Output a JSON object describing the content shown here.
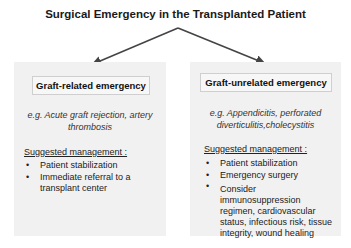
{
  "title": "Surgical Emergency in the Transplanted Patient",
  "colors": {
    "box_bg": "#f1f1f1",
    "header_border": "#cfcfcf",
    "arrow": "#444444",
    "text": "#222222"
  },
  "left": {
    "header": "Graft-related emergency",
    "example": "e.g. Acute graft rejection, artery thrombosis",
    "management_label": "Suggested management :",
    "items": [
      "Patient stabilization",
      "Immediate referral to a transplant center"
    ]
  },
  "right": {
    "header": "Graft-unrelated emergency",
    "example": "e.g. Appendicitis, perforated diverticulitis,cholecystitis",
    "management_label": "Suggested management :",
    "items": [
      "Patient stabilization",
      "Emergency surgery",
      "Consider immunosuppression regimen, cardiovascular status, infectious risk, tissue integrity, wound healing"
    ]
  },
  "bullet": "•"
}
